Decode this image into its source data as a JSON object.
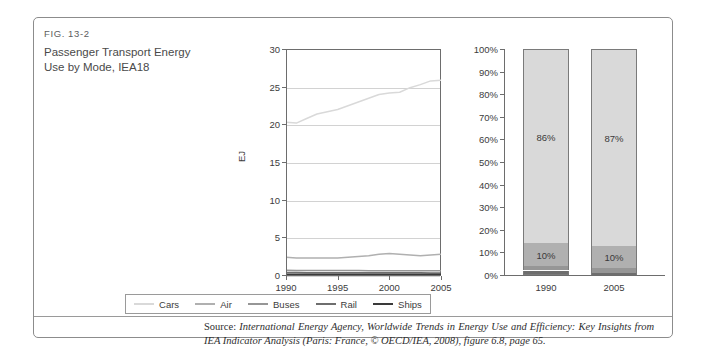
{
  "figure": {
    "number": "FIG. 13-2",
    "title": "Passenger Transport Energy Use by Mode, IEA18"
  },
  "source": {
    "prefix": "Source: ",
    "citation": "International Energy Agency, Worldwide Trends in Energy Use and Efficiency: Key Insights from IEA Indicator Analysis (Paris: France, © OECD/IEA, 2008), figure 6.8, page 65."
  },
  "legend": {
    "items": [
      {
        "label": "Cars",
        "color": "#d9d9d9"
      },
      {
        "label": "Air",
        "color": "#b0b0b0"
      },
      {
        "label": "Buses",
        "color": "#969696"
      },
      {
        "label": "Rail",
        "color": "#6e6e6e"
      },
      {
        "label": "Ships",
        "color": "#3a3a3a"
      }
    ]
  },
  "chart_data": [
    {
      "type": "line",
      "title": "Passenger Transport Energy Use by Mode, IEA18",
      "xlabel": "",
      "ylabel": "EJ",
      "xlim": [
        1990,
        2005
      ],
      "ylim": [
        0,
        30
      ],
      "grid": true,
      "legend_position": "bottom",
      "xticks": [
        "1990",
        "1995",
        "2000",
        "2005"
      ],
      "yticks": [
        "0",
        "5",
        "10",
        "15",
        "20",
        "25",
        "30"
      ],
      "x": [
        1990,
        1991,
        1992,
        1993,
        1994,
        1995,
        1996,
        1997,
        1998,
        1999,
        2000,
        2001,
        2002,
        2003,
        2004,
        2005
      ],
      "series": [
        {
          "name": "Cars",
          "color": "#d9d9d9",
          "values": [
            20.4,
            20.3,
            20.9,
            21.5,
            21.8,
            22.1,
            22.6,
            23.1,
            23.6,
            24.1,
            24.3,
            24.4,
            25.0,
            25.4,
            25.9,
            26.0
          ]
        },
        {
          "name": "Air",
          "color": "#b0b0b0",
          "values": [
            2.5,
            2.4,
            2.4,
            2.4,
            2.4,
            2.4,
            2.5,
            2.6,
            2.7,
            2.9,
            3.0,
            2.9,
            2.8,
            2.7,
            2.8,
            2.9
          ]
        },
        {
          "name": "Buses",
          "color": "#969696",
          "values": [
            0.75,
            0.74,
            0.74,
            0.73,
            0.73,
            0.72,
            0.72,
            0.72,
            0.71,
            0.71,
            0.7,
            0.7,
            0.7,
            0.69,
            0.69,
            0.69
          ]
        },
        {
          "name": "Rail",
          "color": "#6e6e6e",
          "values": [
            0.45,
            0.45,
            0.44,
            0.44,
            0.44,
            0.43,
            0.43,
            0.43,
            0.43,
            0.42,
            0.42,
            0.42,
            0.42,
            0.42,
            0.41,
            0.41
          ]
        },
        {
          "name": "Ships",
          "color": "#3a3a3a",
          "values": [
            0.12,
            0.12,
            0.12,
            0.12,
            0.12,
            0.12,
            0.12,
            0.12,
            0.12,
            0.12,
            0.12,
            0.12,
            0.12,
            0.12,
            0.12,
            0.12
          ]
        }
      ]
    },
    {
      "type": "bar",
      "subtype": "stacked-100",
      "title": "",
      "xlabel": "",
      "ylabel": "",
      "ylim": [
        0,
        100
      ],
      "grid": false,
      "categories": [
        "1990",
        "2005"
      ],
      "yticks": [
        "0%",
        "10%",
        "20%",
        "30%",
        "40%",
        "50%",
        "60%",
        "70%",
        "80%",
        "90%",
        "100%"
      ],
      "series": [
        {
          "name": "Cars",
          "color": "#d9d9d9",
          "values": [
            86,
            87
          ],
          "labels": [
            "86%",
            "87%"
          ]
        },
        {
          "name": "Air",
          "color": "#b0b0b0",
          "values": [
            10,
            10
          ],
          "labels": [
            "10%",
            "10%"
          ]
        },
        {
          "name": "Buses",
          "color": "#969696",
          "values": [
            2,
            2
          ],
          "labels": [
            "",
            ""
          ]
        },
        {
          "name": "Rail",
          "color": "#6e6e6e",
          "values": [
            1.5,
            0.8
          ],
          "labels": [
            "",
            ""
          ]
        },
        {
          "name": "Ships",
          "color": "#3a3a3a",
          "values": [
            0.5,
            0.2
          ],
          "labels": [
            "",
            ""
          ]
        }
      ]
    }
  ]
}
